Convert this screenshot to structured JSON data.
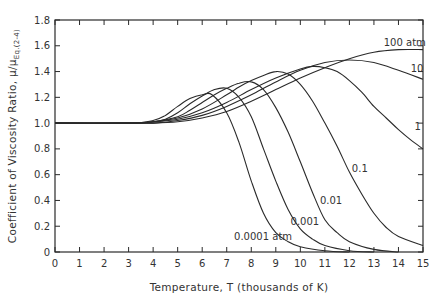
{
  "chart_data": {
    "type": "line",
    "title": "",
    "xlabel": "Temperature, T (thousands of K)",
    "ylabel": "Coefficient of Viscosity Ratio, μ/μ",
    "ylabel_subscript": "Eq.(2-4)",
    "xlim": [
      0,
      15
    ],
    "ylim": [
      0,
      1.8
    ],
    "xticks": [
      0,
      1,
      2,
      3,
      4,
      5,
      6,
      7,
      8,
      9,
      10,
      11,
      12,
      13,
      14,
      15
    ],
    "yticks": [
      0,
      0.2,
      0.4,
      0.6,
      0.8,
      1.0,
      1.2,
      1.4,
      1.6,
      1.8
    ],
    "ytick_labels": [
      "0",
      "0.2",
      "0.4",
      "0.6",
      "0.8",
      "1.0",
      "1.2",
      "1.4",
      "1.6",
      "1.8"
    ],
    "grid": false,
    "legend": "inline curve labels",
    "series": [
      {
        "name": "0.0001 atm",
        "label": "0.0001 atm",
        "points": [
          [
            0,
            1.0
          ],
          [
            3,
            1.0
          ],
          [
            4,
            1.02
          ],
          [
            4.5,
            1.06
          ],
          [
            5,
            1.13
          ],
          [
            5.5,
            1.19
          ],
          [
            6,
            1.22
          ],
          [
            6.4,
            1.22
          ],
          [
            7,
            1.08
          ],
          [
            7.5,
            0.85
          ],
          [
            8,
            0.55
          ],
          [
            8.5,
            0.3
          ],
          [
            9,
            0.15
          ],
          [
            9.5,
            0.08
          ],
          [
            10,
            0.04
          ],
          [
            11,
            0.01
          ],
          [
            12,
            0.0
          ]
        ],
        "label_pos": [
          7.3,
          0.09
        ]
      },
      {
        "name": "0.001 atm",
        "label": "0.001",
        "points": [
          [
            0,
            1.0
          ],
          [
            3,
            1.0
          ],
          [
            4,
            1.01
          ],
          [
            4.5,
            1.03
          ],
          [
            5,
            1.08
          ],
          [
            5.5,
            1.15
          ],
          [
            6,
            1.21
          ],
          [
            6.5,
            1.26
          ],
          [
            7,
            1.27
          ],
          [
            7.5,
            1.2
          ],
          [
            8,
            1.05
          ],
          [
            8.5,
            0.8
          ],
          [
            9,
            0.55
          ],
          [
            9.5,
            0.33
          ],
          [
            10,
            0.18
          ],
          [
            10.5,
            0.1
          ],
          [
            11,
            0.05
          ],
          [
            12,
            0.01
          ],
          [
            13,
            0.0
          ]
        ],
        "label_pos": [
          9.6,
          0.21
        ]
      },
      {
        "name": "0.01 atm",
        "label": "0.01",
        "points": [
          [
            0,
            1.0
          ],
          [
            3,
            1.0
          ],
          [
            4,
            1.01
          ],
          [
            5,
            1.05
          ],
          [
            5.5,
            1.1
          ],
          [
            6,
            1.16
          ],
          [
            6.5,
            1.22
          ],
          [
            7,
            1.27
          ],
          [
            7.5,
            1.31
          ],
          [
            8,
            1.32
          ],
          [
            8.5,
            1.26
          ],
          [
            9,
            1.12
          ],
          [
            9.5,
            0.93
          ],
          [
            10,
            0.7
          ],
          [
            10.5,
            0.46
          ],
          [
            11,
            0.25
          ],
          [
            11.5,
            0.15
          ],
          [
            12,
            0.08
          ],
          [
            13,
            0.02
          ],
          [
            14,
            0.0
          ]
        ],
        "label_pos": [
          10.8,
          0.37
        ]
      },
      {
        "name": "0.1 atm",
        "label": "0.1",
        "points": [
          [
            0,
            1.0
          ],
          [
            3,
            1.0
          ],
          [
            4,
            1.01
          ],
          [
            5,
            1.04
          ],
          [
            6,
            1.11
          ],
          [
            7,
            1.22
          ],
          [
            7.5,
            1.28
          ],
          [
            8,
            1.33
          ],
          [
            8.5,
            1.37
          ],
          [
            9,
            1.4
          ],
          [
            9.5,
            1.38
          ],
          [
            10,
            1.3
          ],
          [
            10.5,
            1.17
          ],
          [
            11,
            1.0
          ],
          [
            11.5,
            0.82
          ],
          [
            12,
            0.62
          ],
          [
            12.5,
            0.45
          ],
          [
            13,
            0.3
          ],
          [
            13.5,
            0.19
          ],
          [
            14,
            0.12
          ],
          [
            15,
            0.05
          ]
        ],
        "label_pos": [
          12.1,
          0.62
        ]
      },
      {
        "name": "1 atm",
        "label": "1",
        "points": [
          [
            0,
            1.0
          ],
          [
            3,
            1.0
          ],
          [
            4,
            1.01
          ],
          [
            5,
            1.03
          ],
          [
            6,
            1.08
          ],
          [
            7,
            1.16
          ],
          [
            8,
            1.26
          ],
          [
            9,
            1.35
          ],
          [
            10,
            1.42
          ],
          [
            10.5,
            1.44
          ],
          [
            11,
            1.43
          ],
          [
            11.5,
            1.4
          ],
          [
            12,
            1.33
          ],
          [
            12.5,
            1.24
          ],
          [
            13,
            1.13
          ],
          [
            13.5,
            1.04
          ],
          [
            14,
            0.95
          ],
          [
            14.5,
            0.87
          ],
          [
            15,
            0.8
          ]
        ],
        "label_pos": [
          14.65,
          0.95
        ]
      },
      {
        "name": "10 atm",
        "label": "10",
        "points": [
          [
            0,
            1.0
          ],
          [
            3,
            1.0
          ],
          [
            4,
            1.0
          ],
          [
            5,
            1.02
          ],
          [
            6,
            1.06
          ],
          [
            7,
            1.13
          ],
          [
            8,
            1.22
          ],
          [
            9,
            1.32
          ],
          [
            10,
            1.41
          ],
          [
            11,
            1.47
          ],
          [
            12,
            1.49
          ],
          [
            13,
            1.47
          ],
          [
            14,
            1.41
          ],
          [
            15,
            1.34
          ]
        ],
        "label_pos": [
          14.5,
          1.4
        ]
      },
      {
        "name": "100 atm",
        "label": "100 atm",
        "points": [
          [
            0,
            1.0
          ],
          [
            3,
            1.0
          ],
          [
            4,
            1.0
          ],
          [
            5,
            1.01
          ],
          [
            6,
            1.04
          ],
          [
            7,
            1.09
          ],
          [
            8,
            1.17
          ],
          [
            9,
            1.26
          ],
          [
            10,
            1.35
          ],
          [
            11,
            1.43
          ],
          [
            12,
            1.5
          ],
          [
            13,
            1.55
          ],
          [
            14,
            1.57
          ],
          [
            15,
            1.57
          ]
        ],
        "label_pos": [
          13.4,
          1.6
        ]
      }
    ]
  },
  "axes": {
    "xlabel": "Temperature, T (thousands of K)",
    "ylabel_main": "Coefficient of Viscosity Ratio, μ/μ",
    "ylabel_sub": "Eq.(2-4)"
  }
}
